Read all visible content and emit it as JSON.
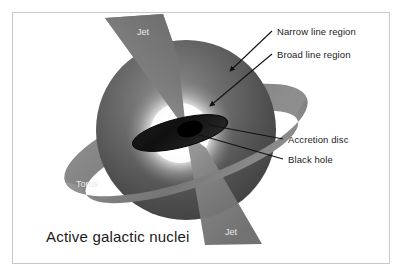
{
  "figure": {
    "title": "Active galactic nuclei",
    "background_color": "#ffffff",
    "frame_color": "#c9c9c9"
  },
  "labels": {
    "narrow_line_region": "Narrow line region",
    "broad_line_region": "Broad line region",
    "accretion_disc": "Accretion disc",
    "black_hole": "Black hole",
    "torus": "Torus",
    "jet_top": "Jet",
    "jet_bottom": "Jet"
  },
  "colors": {
    "sphere_dark": "#4a4a4a",
    "sphere_mid": "#6e6e6e",
    "core_glow": "#ffffff",
    "torus_gray": "#8a8a8a",
    "jet_gray": "#7d7d7d",
    "disc_black": "#151515",
    "label_text": "#1b1b1b",
    "label_text_light": "#e9e9e9",
    "leader_line": "#111111"
  }
}
